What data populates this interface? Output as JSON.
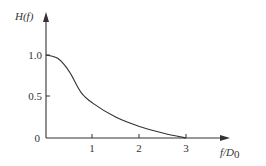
{
  "chart_data": {
    "type": "line",
    "title": "",
    "xlabel": "f/D0",
    "ylabel": "H(f)",
    "xlim": [
      0,
      3.4
    ],
    "ylim": [
      0,
      1.1
    ],
    "grid": false,
    "legend": null,
    "x_ticks": [
      "1",
      "2",
      "3"
    ],
    "y_ticks": [
      "0",
      "0.5",
      "1.0"
    ],
    "series": [
      {
        "name": "H(f)",
        "x": [
          0,
          0.25,
          0.5,
          0.75,
          1.0,
          1.5,
          2.0,
          2.5,
          3.0
        ],
        "values": [
          1.0,
          0.96,
          0.8,
          0.55,
          0.42,
          0.25,
          0.14,
          0.06,
          0.0
        ]
      }
    ]
  },
  "labels": {
    "y_axis_title_main": "H",
    "y_axis_title_paren": "(f)",
    "x_axis_title_main": "f",
    "x_axis_title_sub": "/D",
    "x_axis_title_subscript": "0",
    "tick_x_1": "1",
    "tick_x_2": "2",
    "tick_x_3": "3",
    "tick_y_0": "0",
    "tick_y_05": "0.5",
    "tick_y_1": "1.0"
  }
}
